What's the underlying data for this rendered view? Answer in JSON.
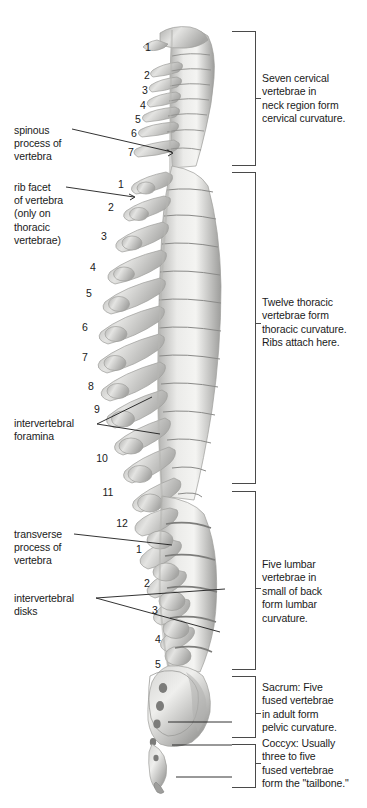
{
  "figure": {
    "background": "#ffffff",
    "ink": "#1a1a1a",
    "bone_light": "#f2f2f0",
    "bone_mid": "#c9c9c7",
    "bone_dark": "#8e8e8c",
    "bone_shadow": "#6d6d6b"
  },
  "callouts": [
    {
      "name": "spinous-process",
      "text": "spinous\nprocess of\nvertebra",
      "x": 14,
      "y": 124
    },
    {
      "name": "rib-facet",
      "text": "rib facet\nof vertebra\n(only on\nthoracic\nvertebrae)",
      "x": 14,
      "y": 181
    },
    {
      "name": "intervertebral-foramina",
      "text": "intervertebral\nforamina",
      "x": 14,
      "y": 417
    },
    {
      "name": "transverse-process",
      "text": "transverse\nprocess of\nvertebra",
      "x": 14,
      "y": 528
    },
    {
      "name": "intervertebral-disks",
      "text": "intervertebral\ndisks",
      "x": 14,
      "y": 592
    }
  ],
  "region_notes": [
    {
      "name": "cervical",
      "text": "Seven cervical\nvertebrae in\nneck region form\ncervical curvature.",
      "x": 262,
      "y": 72,
      "bracket": {
        "top": 31,
        "bottom": 166,
        "left": 232,
        "right": 256
      },
      "tick_y": 98
    },
    {
      "name": "thoracic",
      "text": "Twelve thoracic\nvertebrae form\nthoracic curvature.\nRibs attach here.",
      "x": 262,
      "y": 296,
      "bracket": {
        "top": 172,
        "bottom": 484,
        "left": 232,
        "right": 256
      },
      "tick_y": 323
    },
    {
      "name": "lumbar",
      "text": "Five lumbar\nvertebrae in\nsmall of back\nform lumbar\ncurvature.",
      "x": 262,
      "y": 558,
      "bracket": {
        "top": 491,
        "bottom": 670,
        "left": 232,
        "right": 256
      },
      "tick_y": 588
    },
    {
      "name": "sacrum",
      "text": "Sacrum: Five\nfused vertebrae\nin adult form\npelvic curvature.",
      "x": 262,
      "y": 681,
      "bracket": {
        "top": 676,
        "bottom": 738,
        "left": 232,
        "right": 256
      },
      "tick_y": 716
    },
    {
      "name": "coccyx",
      "text": "Coccyx: Usually\nthree to five\nfused vertebrae\nform the \"tailbone.\"",
      "x": 262,
      "y": 737,
      "bracket": {
        "top": 744,
        "bottom": 788,
        "left": 232,
        "right": 256
      },
      "tick_y": 763
    }
  ],
  "vertebra_numbers": {
    "cervical": [
      {
        "label": "1",
        "x": 141,
        "y": 42
      },
      {
        "label": "2",
        "x": 140,
        "y": 70
      },
      {
        "label": "3",
        "x": 138,
        "y": 85
      },
      {
        "label": "4",
        "x": 136,
        "y": 100
      },
      {
        "label": "5",
        "x": 131,
        "y": 114
      },
      {
        "label": "6",
        "x": 127,
        "y": 128
      },
      {
        "label": "7",
        "x": 124,
        "y": 147
      }
    ],
    "thoracic": [
      {
        "label": "1",
        "x": 114,
        "y": 179
      },
      {
        "label": "2",
        "x": 104,
        "y": 202
      },
      {
        "label": "3",
        "x": 97,
        "y": 231
      },
      {
        "label": "4",
        "x": 86,
        "y": 262
      },
      {
        "label": "5",
        "x": 82,
        "y": 288
      },
      {
        "label": "6",
        "x": 78,
        "y": 322
      },
      {
        "label": "7",
        "x": 78,
        "y": 352
      },
      {
        "label": "8",
        "x": 84,
        "y": 381
      },
      {
        "label": "9",
        "x": 90,
        "y": 404
      },
      {
        "label": "10",
        "x": 95,
        "y": 453
      },
      {
        "label": "11",
        "x": 101,
        "y": 487
      },
      {
        "label": "12",
        "x": 115,
        "y": 518
      }
    ],
    "lumbar": [
      {
        "label": "1",
        "x": 132,
        "y": 544
      },
      {
        "label": "2",
        "x": 140,
        "y": 578
      },
      {
        "label": "3",
        "x": 148,
        "y": 605
      },
      {
        "label": "4",
        "x": 151,
        "y": 634
      },
      {
        "label": "5",
        "x": 151,
        "y": 659
      }
    ]
  },
  "leader_lines": [
    {
      "name": "spinous-process-leader",
      "x1": 72,
      "y1": 129,
      "x2": 172,
      "y2": 152
    },
    {
      "name": "rib-facet-leader",
      "x1": 66,
      "y1": 187,
      "x2": 134,
      "y2": 197
    },
    {
      "name": "foramina-leader-upper",
      "x1": 97,
      "y1": 424,
      "x2": 152,
      "y2": 397
    },
    {
      "name": "foramina-leader-lower",
      "x1": 97,
      "y1": 424,
      "x2": 160,
      "y2": 434
    },
    {
      "name": "transverse-process-leader",
      "x1": 74,
      "y1": 534,
      "x2": 172,
      "y2": 545
    },
    {
      "name": "disks-leader-upper",
      "x1": 96,
      "y1": 598,
      "x2": 225,
      "y2": 589
    },
    {
      "name": "disks-leader-lower",
      "x1": 96,
      "y1": 598,
      "x2": 220,
      "y2": 632
    },
    {
      "name": "sacrum-pointer",
      "x1": 168,
      "y1": 722,
      "x2": 232,
      "y2": 722
    },
    {
      "name": "coccyx-pointer-upper",
      "x1": 172,
      "y1": 745,
      "x2": 232,
      "y2": 745
    },
    {
      "name": "coccyx-pointer-lower",
      "x1": 176,
      "y1": 777,
      "x2": 232,
      "y2": 777
    }
  ]
}
